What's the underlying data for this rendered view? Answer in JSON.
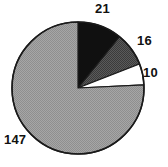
{
  "chart_data": {
    "type": "pie",
    "title": "",
    "subtitle": "",
    "xlabel": "",
    "ylabel": "",
    "total": 194,
    "start_angle_deg": -90,
    "direction": "clockwise",
    "grid": false,
    "legend": "none",
    "labels_shown": true,
    "label_position": "outside",
    "categories": [
      "21",
      "16",
      "10",
      "147"
    ],
    "values": [
      21,
      16,
      10,
      147
    ],
    "slices": [
      {
        "label": "21",
        "value": 21,
        "fill": "#101010",
        "fill_name": "black",
        "percent": 10.8,
        "start_deg": -90,
        "end_deg": -51.0
      },
      {
        "label": "16",
        "value": 16,
        "fill": "#4d4d4d",
        "fill_name": "dark-gray",
        "percent": 8.2,
        "start_deg": -51.0,
        "end_deg": -21.3
      },
      {
        "label": "10",
        "value": 10,
        "fill": "#ffffff",
        "fill_name": "white",
        "percent": 5.2,
        "start_deg": -21.3,
        "end_deg": 0.0
      },
      {
        "label": "147",
        "value": 147,
        "fill": "#9d9d9d",
        "fill_name": "light-gray",
        "percent": 75.8,
        "start_deg": 0.0,
        "end_deg": 270.0
      }
    ],
    "geometry": {
      "center_x": 78,
      "center_y": 88,
      "radius": 66
    },
    "colors": {
      "outline": "#1a1a1a",
      "background": "#ffffff",
      "label_text": "#111111"
    }
  }
}
